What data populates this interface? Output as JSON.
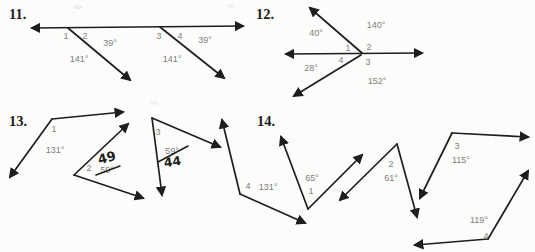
{
  "canvas": {
    "width": 535,
    "height": 252,
    "paper_color": "#fcfcfa",
    "ink_color": "#1e1e1e",
    "label_color": "#7f7f7f",
    "smudges": [
      {
        "x": 78,
        "y": 7,
        "rx": 5,
        "ry": 2,
        "opacity": 0.15
      },
      {
        "x": 231,
        "y": 6,
        "rx": 4,
        "ry": 2,
        "opacity": 0.1
      },
      {
        "x": 154,
        "y": 103,
        "rx": 4,
        "ry": 2,
        "opacity": 0.1
      },
      {
        "x": 336,
        "y": 190,
        "rx": 5,
        "ry": 2,
        "opacity": 0.08
      }
    ]
  },
  "problems": [
    {
      "id": "11",
      "number": "11.",
      "number_pos": {
        "x": 9,
        "y": 19
      },
      "lines": [
        {
          "name": "transversal-main-line",
          "x1": 32,
          "y1": 28,
          "x2": 243,
          "y2": 26,
          "arrow_start": true,
          "arrow_end": true
        },
        {
          "name": "ray",
          "x1": 68,
          "y1": 28,
          "x2": 130,
          "y2": 80,
          "arrow_end": true
        },
        {
          "name": "ray",
          "x1": 160,
          "y1": 27,
          "x2": 224,
          "y2": 78,
          "arrow_end": true
        }
      ],
      "angle_numbers": [
        {
          "text": "1",
          "x": 66,
          "y": 39
        },
        {
          "text": "2",
          "x": 85,
          "y": 39
        },
        {
          "text": "3",
          "x": 159,
          "y": 39
        },
        {
          "text": "4",
          "x": 180,
          "y": 39
        }
      ],
      "angle_measures": [
        {
          "text": "39°",
          "x": 110,
          "y": 46
        },
        {
          "text": "141°",
          "x": 79,
          "y": 62
        },
        {
          "text": "39°",
          "x": 205,
          "y": 43
        },
        {
          "text": "141°",
          "x": 172,
          "y": 62
        }
      ]
    },
    {
      "id": "12",
      "number": "12.",
      "number_pos": {
        "x": 256,
        "y": 19
      },
      "lines": [
        {
          "name": "horizontal-line",
          "x1": 286,
          "y1": 54,
          "x2": 422,
          "y2": 53,
          "arrow_start": true,
          "arrow_end": true
        },
        {
          "name": "ray",
          "x1": 362,
          "y1": 53,
          "x2": 310,
          "y2": 8,
          "arrow_end": true
        },
        {
          "name": "ray",
          "x1": 361,
          "y1": 55,
          "x2": 294,
          "y2": 96,
          "arrow_end": true
        }
      ],
      "angle_numbers": [
        {
          "text": "1",
          "x": 348,
          "y": 51
        },
        {
          "text": "2",
          "x": 369,
          "y": 50
        },
        {
          "text": "4",
          "x": 341,
          "y": 63
        },
        {
          "text": "3",
          "x": 368,
          "y": 65
        }
      ],
      "angle_measures": [
        {
          "text": "40°",
          "x": 316,
          "y": 36
        },
        {
          "text": "140°",
          "x": 376,
          "y": 28
        },
        {
          "text": "28°",
          "x": 311,
          "y": 71
        },
        {
          "text": "152°",
          "x": 377,
          "y": 84
        }
      ]
    },
    {
      "id": "13",
      "number": "13.",
      "number_pos": {
        "x": 9,
        "y": 126
      },
      "lines": [
        {
          "name": "ray",
          "x1": 52,
          "y1": 119,
          "x2": 123,
          "y2": 112,
          "arrow_end": true
        },
        {
          "name": "ray",
          "x1": 52,
          "y1": 119,
          "x2": 10,
          "y2": 177,
          "arrow_end": true
        },
        {
          "name": "ray",
          "x1": 74,
          "y1": 175,
          "x2": 128,
          "y2": 124,
          "arrow_end": true
        },
        {
          "name": "ray",
          "x1": 74,
          "y1": 175,
          "x2": 143,
          "y2": 198,
          "arrow_end": true
        },
        {
          "name": "ray",
          "x1": 152,
          "y1": 118,
          "x2": 220,
          "y2": 147,
          "arrow_end": true
        },
        {
          "name": "ray",
          "x1": 152,
          "y1": 118,
          "x2": 162,
          "y2": 195,
          "arrow_end": true
        },
        {
          "name": "ray",
          "x1": 240,
          "y1": 194,
          "x2": 222,
          "y2": 120,
          "arrow_end": true
        },
        {
          "name": "ray",
          "x1": 240,
          "y1": 194,
          "x2": 305,
          "y2": 223,
          "arrow_end": true
        }
      ],
      "angle_numbers": [
        {
          "text": "1",
          "x": 54,
          "y": 132
        },
        {
          "text": "2",
          "x": 89,
          "y": 171
        },
        {
          "text": "3",
          "x": 158,
          "y": 135
        },
        {
          "text": "4",
          "x": 248,
          "y": 189
        }
      ],
      "angle_measures": [
        {
          "text": "131°",
          "x": 55,
          "y": 153
        },
        {
          "text": "59°",
          "x": 107,
          "y": 173,
          "struck": true
        },
        {
          "text": "59°",
          "x": 172,
          "y": 154,
          "struck": true
        },
        {
          "text": "131°",
          "x": 268,
          "y": 190
        }
      ],
      "handwritten": [
        {
          "text": "49",
          "x": 108,
          "y": 162,
          "rotate": -15,
          "size": 13
        },
        {
          "text": "44",
          "x": 173,
          "y": 166,
          "rotate": -8,
          "size": 12.5
        }
      ],
      "pen_strikes": [
        {
          "x1": 96,
          "y1": 175,
          "x2": 120,
          "y2": 166
        },
        {
          "x1": 158,
          "y1": 162,
          "x2": 188,
          "y2": 146
        }
      ]
    },
    {
      "id": "14",
      "number": "14.",
      "number_pos": {
        "x": 257,
        "y": 126
      },
      "lines": [
        {
          "name": "ray",
          "x1": 308,
          "y1": 209,
          "x2": 281,
          "y2": 137,
          "arrow_end": true
        },
        {
          "name": "ray",
          "x1": 308,
          "y1": 209,
          "x2": 362,
          "y2": 155,
          "arrow_end": true
        },
        {
          "name": "ray",
          "x1": 397,
          "y1": 144,
          "x2": 340,
          "y2": 200,
          "arrow_end": true
        },
        {
          "name": "ray",
          "x1": 397,
          "y1": 144,
          "x2": 417,
          "y2": 217,
          "arrow_end": true
        },
        {
          "name": "ray",
          "x1": 452,
          "y1": 133,
          "x2": 420,
          "y2": 198,
          "arrow_end": true
        },
        {
          "name": "ray",
          "x1": 452,
          "y1": 133,
          "x2": 528,
          "y2": 137,
          "arrow_end": true
        },
        {
          "name": "ray",
          "x1": 488,
          "y1": 239,
          "x2": 415,
          "y2": 245,
          "arrow_end": true
        },
        {
          "name": "ray",
          "x1": 488,
          "y1": 239,
          "x2": 528,
          "y2": 171,
          "arrow_end": true
        }
      ],
      "angle_numbers": [
        {
          "text": "1",
          "x": 311,
          "y": 194
        },
        {
          "text": "2",
          "x": 391,
          "y": 167
        },
        {
          "text": "3",
          "x": 457,
          "y": 149
        },
        {
          "text": "4",
          "x": 486,
          "y": 239
        }
      ],
      "angle_measures": [
        {
          "text": "65°",
          "x": 312,
          "y": 181
        },
        {
          "text": "61°",
          "x": 391,
          "y": 181
        },
        {
          "text": "115°",
          "x": 461,
          "y": 163
        },
        {
          "text": "119°",
          "x": 479,
          "y": 223
        }
      ]
    }
  ]
}
